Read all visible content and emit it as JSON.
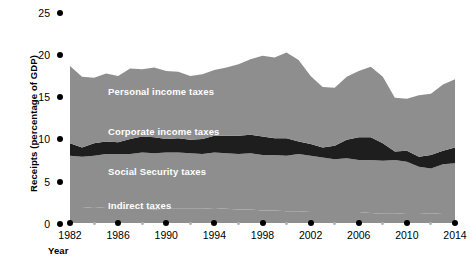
{
  "chart_data": {
    "type": "area",
    "title": "",
    "xlabel": "Year",
    "ylabel": "Receipts (percentage of GDP)",
    "stacked": true,
    "grid": false,
    "legend_position": "inline-labels",
    "xlim": [
      1982,
      2014
    ],
    "ylim": [
      0,
      25
    ],
    "yticks": [
      0,
      5,
      10,
      15,
      20,
      25
    ],
    "xticks": [
      1982,
      1986,
      1990,
      1994,
      1998,
      2002,
      2006,
      2010,
      2014
    ],
    "x_minor_ticks": [
      1984,
      1988,
      1992,
      1996,
      2000,
      2004,
      2008,
      2012
    ],
    "x": [
      1982,
      1983,
      1984,
      1985,
      1986,
      1987,
      1988,
      1989,
      1990,
      1991,
      1992,
      1993,
      1994,
      1995,
      1996,
      1997,
      1998,
      1999,
      2000,
      2001,
      2002,
      2003,
      2004,
      2005,
      2006,
      2007,
      2008,
      2009,
      2010,
      2011,
      2012,
      2013,
      2014
    ],
    "series": [
      {
        "name": "Indirect taxes",
        "color": "#8e8e8e",
        "values": [
          1.8,
          1.8,
          1.9,
          1.8,
          1.8,
          1.7,
          1.7,
          1.6,
          1.7,
          1.7,
          1.7,
          1.7,
          1.8,
          1.7,
          1.6,
          1.6,
          1.5,
          1.5,
          1.4,
          1.4,
          1.3,
          1.3,
          1.3,
          1.3,
          1.3,
          1.2,
          1.1,
          1.1,
          1.2,
          1.2,
          1.1,
          1.2,
          1.2
        ]
      },
      {
        "name": "Social Security taxes",
        "color": "#8e8e8e",
        "values": [
          6.2,
          6.1,
          6.1,
          6.4,
          6.4,
          6.5,
          6.7,
          6.7,
          6.7,
          6.7,
          6.6,
          6.5,
          6.6,
          6.6,
          6.6,
          6.7,
          6.6,
          6.6,
          6.6,
          6.8,
          6.7,
          6.5,
          6.3,
          6.4,
          6.2,
          6.3,
          6.3,
          6.4,
          6.1,
          5.5,
          5.4,
          5.8,
          5.9
        ]
      },
      {
        "name": "Corporate income taxes",
        "color": "#1e1e1e",
        "values": [
          1.5,
          1.1,
          1.5,
          1.5,
          1.4,
          1.8,
          1.9,
          1.9,
          1.6,
          1.7,
          1.6,
          1.8,
          2.0,
          2.1,
          2.2,
          2.2,
          2.2,
          2.0,
          2.1,
          1.5,
          1.4,
          1.2,
          1.6,
          2.2,
          2.7,
          2.7,
          2.1,
          1.0,
          1.3,
          1.2,
          1.6,
          1.6,
          1.9
        ]
      },
      {
        "name": "Personal income taxes",
        "color": "#8e8e8e",
        "values": [
          9.2,
          8.4,
          7.8,
          8.1,
          7.9,
          8.4,
          8.0,
          8.3,
          8.1,
          7.9,
          7.6,
          7.7,
          7.8,
          8.1,
          8.5,
          9.0,
          9.6,
          9.6,
          10.2,
          9.7,
          8.1,
          7.2,
          6.9,
          7.5,
          7.9,
          8.4,
          7.9,
          6.4,
          6.2,
          7.3,
          7.3,
          7.9,
          8.1
        ]
      }
    ],
    "total_label": "Receipts (percentage of GDP)"
  },
  "axes": {
    "y_title": "Receipts (percentage of GDP)",
    "x_title": "Year",
    "y_tick_labels": [
      "25",
      "20",
      "15",
      "10",
      "5",
      "0"
    ],
    "x_tick_labels": [
      "1982",
      "1986",
      "1990",
      "1994",
      "1998",
      "2002",
      "2006",
      "2010",
      "2014"
    ]
  },
  "series_labels": {
    "personal": "Personal income taxes",
    "corporate": "Corporate income taxes",
    "social_security": "Social Security taxes",
    "indirect": "Indirect taxes"
  },
  "colors": {
    "area_gray": "#8e8e8e",
    "area_dark": "#1e1e1e",
    "tick_major": "#000000",
    "tick_minor": "#b6b6b6",
    "background": "#ffffff",
    "label_text": "#ffffff"
  }
}
